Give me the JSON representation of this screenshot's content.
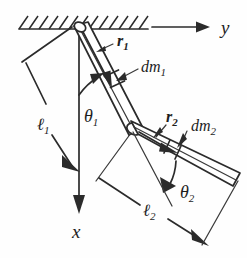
{
  "figure": {
    "background_color": "#fefefe",
    "ink_color": "#2b2b2b"
  },
  "axes": {
    "horizontal": {
      "label": "y",
      "name": "y-axis",
      "direction": "right"
    },
    "vertical": {
      "label": "x",
      "name": "x-axis",
      "direction": "down"
    }
  },
  "support": {
    "name": "ceiling-hatching",
    "hatch_count": 13,
    "hatch_direction": "up-right"
  },
  "labels": {
    "r1": {
      "base": "r",
      "sub": "1"
    },
    "r2": {
      "base": "r",
      "sub": "2"
    },
    "dm1": {
      "base": "dm",
      "sub": "1"
    },
    "dm2": {
      "base": "dm",
      "sub": "2"
    },
    "theta1": {
      "base": "θ",
      "sub": "1"
    },
    "theta2": {
      "base": "θ",
      "sub": "2"
    },
    "l1": {
      "base": "ℓ",
      "sub": "1"
    },
    "l2": {
      "base": "ℓ",
      "sub": "2"
    }
  },
  "links": [
    {
      "name": "link-1",
      "length_label": "ℓ",
      "length_sub": "1",
      "angle_label": "θ",
      "angle_sub": "1",
      "vector_label": "r",
      "vector_sub": "1",
      "mass_element_label": "dm",
      "mass_element_sub": "1",
      "angle_from": "x-axis (vertical)"
    },
    {
      "name": "link-2",
      "length_label": "ℓ",
      "length_sub": "2",
      "angle_label": "θ",
      "angle_sub": "2",
      "vector_label": "r",
      "vector_sub": "2",
      "mass_element_label": "dm",
      "mass_element_sub": "2",
      "angle_from": "link-1 extension"
    }
  ],
  "joints": [
    {
      "name": "pivot-ground",
      "type": "fixed-pin"
    },
    {
      "name": "pivot-elbow",
      "type": "revolute-pin"
    }
  ]
}
